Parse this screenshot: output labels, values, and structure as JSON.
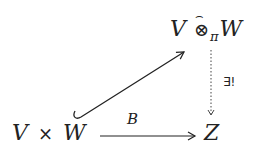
{
  "diagram": {
    "type": "commutative-diagram",
    "nodes": {
      "product": {
        "V": "V",
        "times": "×",
        "W": "W"
      },
      "tensor": {
        "V": "V",
        "otimes": "⊗",
        "hat": "⌢",
        "sub": "π",
        "W": "W"
      },
      "target": {
        "Z": "Z"
      }
    },
    "arrows": {
      "embedding": {
        "style": "hook-arrow",
        "from": "V × W",
        "to": "V ⊗̂_π W"
      },
      "bilinear": {
        "style": "solid-arrow",
        "label": "B",
        "from": "V × W",
        "to": "Z"
      },
      "unique": {
        "style": "dotted-arrow",
        "label": "∃!",
        "from": "V ⊗̂_π W",
        "to": "Z"
      }
    }
  }
}
